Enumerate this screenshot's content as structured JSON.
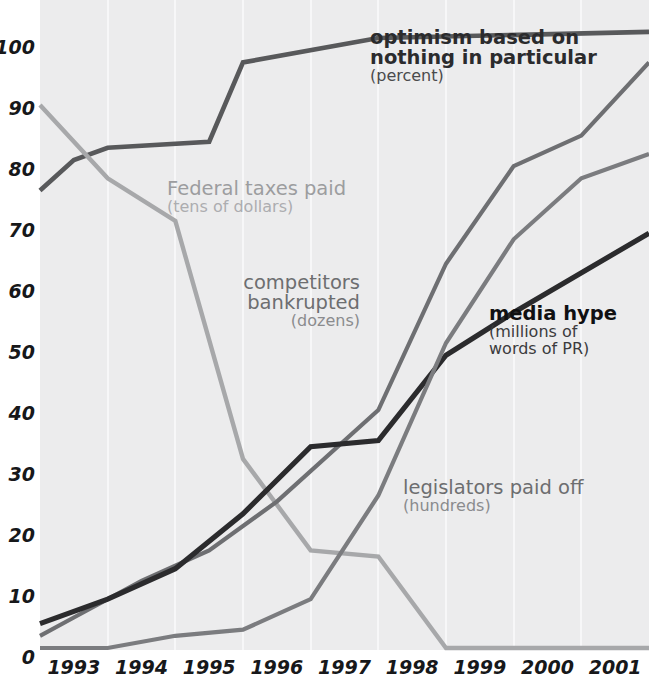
{
  "chart_data": {
    "type": "line",
    "title": "",
    "xlabel": "",
    "ylabel": "",
    "xlim": [
      1992.5,
      2001.5
    ],
    "ylim": [
      0,
      100
    ],
    "grid": "vertical",
    "legend_position": "inline-annotations",
    "categories": [
      "1993",
      "1994",
      "1995",
      "1996",
      "1997",
      "1998",
      "1999",
      "2000",
      "2001"
    ],
    "ytick_labels": [
      "0",
      "10",
      "20",
      "30",
      "40",
      "50",
      "60",
      "70",
      "80",
      "90",
      "100"
    ],
    "ytick_values": [
      0,
      10,
      20,
      30,
      40,
      50,
      60,
      70,
      80,
      90,
      100
    ],
    "series": [
      {
        "name": "optimism based on nothing in particular",
        "units": "percent",
        "color": "#58595b",
        "x": [
          1992.5,
          1993.0,
          1993.5,
          1995.0,
          1995.5,
          1997.5,
          2001.5
        ],
        "values": [
          75,
          80,
          82,
          83,
          96,
          100,
          101
        ]
      },
      {
        "name": "Federal taxes paid",
        "units": "tens of dollars",
        "color": "#a7a8aa",
        "x": [
          1992.5,
          1993.5,
          1994.5,
          1995.5,
          1996.5,
          1997.5,
          1998.5,
          2001.5
        ],
        "values": [
          89,
          77,
          70,
          31,
          16,
          15,
          0,
          0
        ]
      },
      {
        "name": "competitors bankrupted",
        "units": "dozens",
        "color": "#6e6f72",
        "x": [
          1992.5,
          1993.0,
          1994.0,
          1995.0,
          1996.0,
          1997.5,
          1998.5,
          1999.5,
          2000.5,
          2001.5
        ],
        "values": [
          2,
          5,
          11,
          16,
          24,
          39,
          63,
          79,
          84,
          96
        ]
      },
      {
        "name": "media hype",
        "units": "millions of words of PR",
        "color": "#2b2b2d",
        "x": [
          1992.5,
          1993.5,
          1994.5,
          1995.5,
          1996.5,
          1997.5,
          1998.5,
          1999.5,
          2001.5
        ],
        "values": [
          4,
          8,
          13,
          22,
          33,
          34,
          48,
          55,
          68
        ]
      },
      {
        "name": "legislators paid off",
        "units": "hundreds",
        "color": "#7b7c7f",
        "x": [
          1992.5,
          1993.5,
          1994.5,
          1995.5,
          1996.5,
          1997.5,
          1998.5,
          1999.5,
          2000.5,
          2001.5
        ],
        "values": [
          0,
          0,
          2,
          3,
          8,
          25,
          50,
          67,
          77,
          81
        ]
      }
    ],
    "annotations": [
      {
        "id": "optimism",
        "main_line_1": "optimism based on",
        "main_line_2": "nothing in particular",
        "sub": "(percent)"
      },
      {
        "id": "federal-taxes",
        "main_line_1": "Federal taxes paid",
        "sub": "(tens of dollars)"
      },
      {
        "id": "competitors",
        "main_line_1": "competitors",
        "main_line_2": "bankrupted",
        "sub": "(dozens)"
      },
      {
        "id": "media-hype",
        "main_line_1": "media hype",
        "sub_line_1": "(millions of",
        "sub_line_2": "words of PR)"
      },
      {
        "id": "legislators",
        "main_line_1": "legislators paid off",
        "sub": "(hundreds)"
      }
    ]
  },
  "axis": {
    "y_labels": [
      "100",
      "90",
      "80",
      "70",
      "60",
      "50",
      "40",
      "30",
      "20",
      "10",
      "0"
    ],
    "x_labels": [
      "1993",
      "1994",
      "1995",
      "1996",
      "1997",
      "1998",
      "1999",
      "2000",
      "2001"
    ]
  },
  "colors": {
    "plot_background": "#ececed",
    "gridline": "#f7f7f8",
    "page_background": "#ffffff",
    "tick_text": "#17181a",
    "optimism": "#58595b",
    "federal_taxes": "#a7a8aa",
    "competitors": "#6e6f72",
    "media_hype": "#2b2b2d",
    "legislators": "#7b7c7f"
  }
}
